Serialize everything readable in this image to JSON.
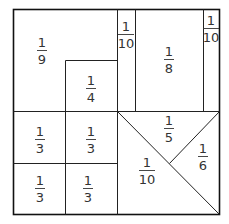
{
  "diagram": {
    "regions": [
      {
        "id": "r1",
        "num": "1",
        "den": "9",
        "cx": 42,
        "cy": 50
      },
      {
        "id": "r2",
        "num": "1",
        "den": "4",
        "cx": 91,
        "cy": 88
      },
      {
        "id": "r3",
        "num": "1",
        "den": "10",
        "cx": 126,
        "cy": 34
      },
      {
        "id": "r4",
        "num": "1",
        "den": "8",
        "cx": 169,
        "cy": 59
      },
      {
        "id": "r5",
        "num": "1",
        "den": "10",
        "cx": 211,
        "cy": 28
      },
      {
        "id": "r6",
        "num": "1",
        "den": "3",
        "cx": 40,
        "cy": 139
      },
      {
        "id": "r7",
        "num": "1",
        "den": "3",
        "cx": 91,
        "cy": 139
      },
      {
        "id": "r8",
        "num": "1",
        "den": "3",
        "cx": 40,
        "cy": 188
      },
      {
        "id": "r9",
        "num": "1",
        "den": "3",
        "cx": 88,
        "cy": 188
      },
      {
        "id": "r10",
        "num": "1",
        "den": "5",
        "cx": 169,
        "cy": 128
      },
      {
        "id": "r11",
        "num": "1",
        "den": "6",
        "cx": 203,
        "cy": 156
      },
      {
        "id": "r12",
        "num": "1",
        "den": "10",
        "cx": 147,
        "cy": 170
      }
    ]
  }
}
